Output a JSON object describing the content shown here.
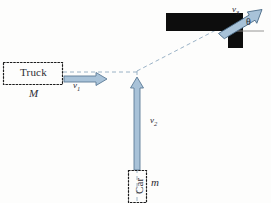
{
  "diagram": {
    "background_color": "#fdfdfc",
    "objects": {
      "truck": {
        "label": "Truck",
        "mass_symbol": "M",
        "box": {
          "x": 3,
          "y": 62,
          "w": 60,
          "h": 23
        },
        "border_style": "dotted",
        "border_color": "#1b1b1b"
      },
      "car": {
        "label": "Car",
        "label_rotation_deg": -90,
        "mass_symbol": "m",
        "box": {
          "x": 128,
          "y": 170,
          "w": 19,
          "h": 33
        },
        "border_style": "dotted",
        "border_color": "#1b1b1b"
      },
      "wreck": {
        "description": "combined-wreck-polygon",
        "fill_color": "#0d0d0d",
        "points": "166,13 243,13 243,48 228,48 228,31 166,31"
      }
    },
    "vectors": [
      {
        "name": "v1",
        "label": "v",
        "subscript": "1",
        "direction": "right",
        "label_pos": {
          "x": 74,
          "y": 82
        },
        "color_fill": "#a8c2d8",
        "color_stroke": "#5b7b96"
      },
      {
        "name": "v2",
        "label": "v",
        "subscript": "2",
        "direction": "up",
        "label_pos": {
          "x": 150,
          "y": 118
        },
        "color_fill": "#a8c2d8",
        "color_stroke": "#5b7b96"
      },
      {
        "name": "v3",
        "label": "v",
        "subscript": "3",
        "direction": "up-right",
        "label_pos": {
          "x": 233,
          "y": 10
        },
        "color_fill": "#a8c2d8",
        "color_stroke": "#4a6a86"
      }
    ],
    "angle": {
      "symbol": "θ",
      "label_pos": {
        "x": 248,
        "y": 21
      },
      "reference_line": "horizontal"
    },
    "trajectories": {
      "color": "#8fa9c0",
      "style": "dashed",
      "collision_point": {
        "x": 137,
        "y": 72
      },
      "paths": [
        {
          "name": "truck-path",
          "from": [
            63,
            72
          ],
          "to": [
            137,
            72
          ]
        },
        {
          "name": "car-path",
          "from": [
            137,
            200
          ],
          "to": [
            137,
            72
          ]
        },
        {
          "name": "wreck-path",
          "from": [
            137,
            72
          ],
          "to": [
            215,
            31
          ]
        }
      ]
    }
  }
}
